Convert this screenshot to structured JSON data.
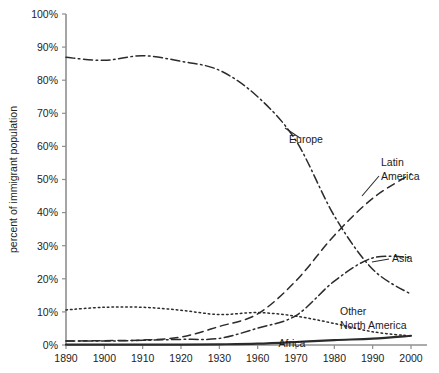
{
  "chart_data": {
    "type": "line",
    "title": "",
    "subtitle": "",
    "xlabel": "",
    "ylabel": "percent of immigrant population",
    "categories": [
      "1890",
      "1900",
      "1910",
      "1920",
      "1930",
      "1960",
      "1970",
      "1980",
      "1990",
      "2000"
    ],
    "x_tick_labels": [
      "1890",
      "1900",
      "1910",
      "1920",
      "1930",
      "1960",
      "1970",
      "1980",
      "1990",
      "2000"
    ],
    "y_tick_labels": [
      "0%",
      "10%",
      "20%",
      "30%",
      "40%",
      "50%",
      "60%",
      "70%",
      "80%",
      "90%",
      "100%"
    ],
    "y_tick_values": [
      0,
      10,
      20,
      30,
      40,
      50,
      60,
      70,
      80,
      90,
      100
    ],
    "ylim": [
      0,
      100
    ],
    "grid": false,
    "legend_position": "inline-annotations",
    "series": [
      {
        "name": "Europe",
        "label": "Europe",
        "style": "dash-dot",
        "color": "#2b2b2b",
        "values": [
          86.9,
          86.0,
          87.4,
          85.7,
          83.0,
          75.0,
          61.7,
          39.0,
          22.9,
          15.3
        ]
      },
      {
        "name": "Latin America",
        "label": "Latin America",
        "style": "dashed",
        "color": "#2b2b2b",
        "values": [
          1.2,
          1.3,
          1.5,
          2.4,
          5.6,
          9.4,
          19.4,
          33.1,
          44.3,
          51.7
        ]
      },
      {
        "name": "Asia",
        "label": "Asia",
        "style": "dash-dot",
        "color": "#2b2b2b",
        "values": [
          1.2,
          1.2,
          1.4,
          1.7,
          2.0,
          5.1,
          8.9,
          19.3,
          26.3,
          26.4
        ]
      },
      {
        "name": "Other North America",
        "label": "Other North America",
        "style": "dotted",
        "color": "#2b2b2b",
        "values": [
          10.6,
          11.4,
          11.4,
          10.5,
          9.2,
          9.8,
          8.7,
          6.5,
          4.0,
          2.7
        ]
      },
      {
        "name": "Africa",
        "label": "Africa",
        "style": "solid",
        "color": "#8a8a8a",
        "values": [
          0.1,
          0.1,
          0.1,
          0.1,
          0.2,
          0.4,
          0.9,
          1.5,
          1.9,
          2.8
        ]
      }
    ],
    "annotations": [
      {
        "name": "europe-label",
        "text": "Europe",
        "x": 306,
        "y": 143
      },
      {
        "name": "latin-america-label",
        "text": "Latin",
        "x": 381,
        "y": 166
      },
      {
        "name": "latin-america-label-2",
        "text": "America",
        "x": 381,
        "y": 180
      },
      {
        "name": "asia-label",
        "text": "Asia",
        "x": 392,
        "y": 262
      },
      {
        "name": "other-north-america-label",
        "text": "Other",
        "x": 340,
        "y": 315
      },
      {
        "name": "other-north-america-label-2",
        "text": "North America",
        "x": 340,
        "y": 329
      },
      {
        "name": "africa-label",
        "text": "Africa",
        "x": 292,
        "y": 347
      }
    ]
  }
}
